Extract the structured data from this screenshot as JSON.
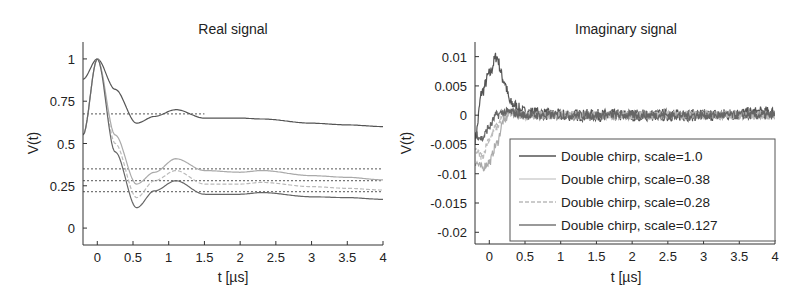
{
  "chart_data": [
    {
      "type": "line",
      "title": "Real signal",
      "xlabel": "t [µs]",
      "ylabel": "V(t)",
      "xlim": [
        -0.2,
        4
      ],
      "ylim": [
        -0.1,
        1.1
      ],
      "xticks": [
        "0",
        "0.5",
        "1",
        "1.5",
        "2",
        "2.5",
        "3",
        "3.5",
        "4"
      ],
      "yticks": [
        "0",
        "0.25",
        "0.5",
        "0.75",
        "1"
      ],
      "grid": false,
      "x": [
        -0.2,
        0,
        0.25,
        0.55,
        0.8,
        1.1,
        1.5,
        2.0,
        2.3,
        3.0,
        3.5,
        4.0
      ],
      "series": [
        {
          "name": "Double chirp, scale=1.0",
          "color": "#555555",
          "values": [
            0.88,
            1.0,
            0.82,
            0.62,
            0.66,
            0.7,
            0.65,
            0.65,
            0.645,
            0.62,
            0.61,
            0.6
          ]
        },
        {
          "name": "Double chirp, scale=0.38",
          "color": "#aaaaaa",
          "values": [
            0.55,
            1.0,
            0.55,
            0.26,
            0.33,
            0.41,
            0.34,
            0.33,
            0.34,
            0.31,
            0.3,
            0.285
          ]
        },
        {
          "name": "Double chirp, scale=0.28",
          "color": "#bbbbbb",
          "values": [
            0.55,
            1.0,
            0.5,
            0.18,
            0.28,
            0.34,
            0.26,
            0.26,
            0.27,
            0.245,
            0.235,
            0.225
          ]
        },
        {
          "name": "Double chirp, scale=0.127",
          "color": "#666666",
          "values": [
            0.55,
            1.0,
            0.45,
            0.12,
            0.22,
            0.28,
            0.2,
            0.2,
            0.21,
            0.185,
            0.18,
            0.17
          ]
        }
      ],
      "reference_lines": [
        {
          "y": 0.675,
          "style": "dotted",
          "x_end": 1.5
        },
        {
          "y": 0.35,
          "style": "dotted",
          "x_end": 4
        },
        {
          "y": 0.28,
          "style": "dotted",
          "x_end": 4
        },
        {
          "y": 0.215,
          "style": "dotted",
          "x_end": 4
        }
      ]
    },
    {
      "type": "line",
      "title": "Imaginary signal",
      "xlabel": "t [µs]",
      "ylabel": "V(t)",
      "xlim": [
        -0.2,
        4
      ],
      "ylim": [
        -0.022,
        0.0125
      ],
      "xticks": [
        "0",
        "0.5",
        "1",
        "1.5",
        "2",
        "2.5",
        "3",
        "3.5",
        "4"
      ],
      "yticks": [
        "-0.02",
        "-0.015",
        "-0.01",
        "-0.005",
        "0",
        "0.005",
        "0.01"
      ],
      "grid": false,
      "legend_position": "lower right",
      "x": [
        -0.2,
        -0.1,
        0,
        0.1,
        0.2,
        0.3,
        0.5,
        1.0,
        2.0,
        3.0,
        4.0
      ],
      "series": [
        {
          "name": "Double chirp, scale=1.0",
          "color": "#555555",
          "values": [
            -0.004,
            0.004,
            0.007,
            0.01,
            0.006,
            0.002,
            0.0005,
            0.0,
            0.0,
            0.0,
            0.0005
          ]
        },
        {
          "name": "Double chirp, scale=0.38",
          "color": "#aaaaaa",
          "values": [
            -0.008,
            -0.009,
            -0.008,
            -0.005,
            -0.001,
            0.0005,
            0.0,
            0.0,
            0.0,
            0.0,
            0.0
          ]
        },
        {
          "name": "Double chirp, scale=0.28",
          "color": "#bbbbbb",
          "values": [
            -0.006,
            -0.007,
            -0.004,
            -0.002,
            0.0,
            0.0005,
            0.0,
            0.0,
            0.0,
            0.0,
            0.0
          ]
        },
        {
          "name": "Double chirp, scale=0.127",
          "color": "#666666",
          "values": [
            -0.003,
            -0.004,
            -0.002,
            0.0,
            0.0005,
            0.0005,
            0.0,
            0.0,
            0.0,
            0.0,
            0.0
          ]
        }
      ],
      "noise_amplitude": 0.0015
    }
  ],
  "left": {
    "title": "Real signal",
    "xlabel": "t [µs]",
    "ylabel": "V(t)",
    "xticks": [
      "0",
      "0.5",
      "1",
      "1.5",
      "2",
      "2.5",
      "3",
      "3.5",
      "4"
    ],
    "yticks": [
      "0",
      "0.25",
      "0.5",
      "0.75",
      "1"
    ]
  },
  "right": {
    "title": "Imaginary signal",
    "xlabel": "t [µs]",
    "ylabel": "V(t)",
    "xticks": [
      "0",
      "0.5",
      "1",
      "1.5",
      "2",
      "2.5",
      "3",
      "3.5",
      "4"
    ],
    "yticks": [
      "0.01",
      "0.005",
      "0",
      "-0.005",
      "-0.01",
      "-0.015",
      "-0.02"
    ],
    "legend": [
      {
        "label": "Double chirp, scale=1.0",
        "color": "#555555"
      },
      {
        "label": "Double chirp, scale=0.38",
        "color": "#cfcfcf"
      },
      {
        "label": "Double chirp, scale=0.28",
        "color": "#bbbbbb"
      },
      {
        "label": "Double chirp, scale=0.127",
        "color": "#777777"
      }
    ]
  }
}
